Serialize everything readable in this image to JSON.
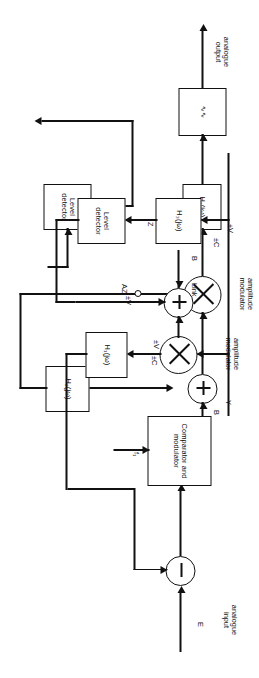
{
  "diagram": {
    "orientation": "rotated-90",
    "receiver": {
      "output_label": "analogue\noutput",
      "lowpass_filter_label": "∿∿",
      "filter_h1_label": "H₁(jω)",
      "modulator_label": "amplitude\nmodulator",
      "modulator_gain_label": "±C",
      "sum_input_label": "B",
      "filter_h2_label": "H₂(jω)",
      "level_detector_label": "Level\ndetector"
    },
    "link": {
      "link_label": "Link",
      "line_level_label": "±V"
    },
    "transmitter": {
      "input_label": "analogue\ninput",
      "input_signal_label": "E",
      "clock_label": "f₁",
      "comparator_label": "Comparator\nand modulator",
      "comparator_output_label": "Y",
      "level_label_mod": "±V",
      "level_label_h3": "±V",
      "modulator_label": "amplitude\nmodulator",
      "modulator_gain_label": "±C",
      "sum_input_label": "B",
      "filter_h1_label": "H₁(jω)",
      "filter_h3_label": "H₃(jω)",
      "h3_output_label": "Z",
      "level_detector_label": "Level\ndetector",
      "feedback_label": "AZ"
    },
    "colors": {
      "line": "#111111",
      "background": "#ffffff"
    }
  }
}
